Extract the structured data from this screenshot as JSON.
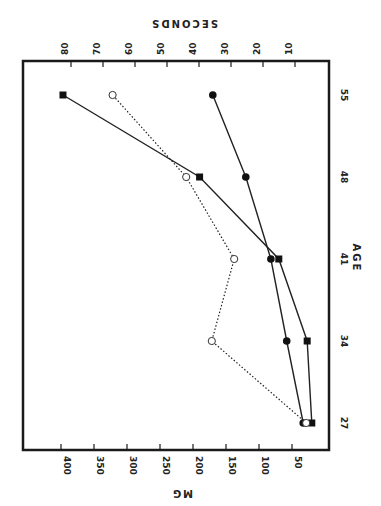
{
  "chart_data": {
    "type": "line",
    "title": "",
    "orientation": "rotated-90-counterclockwise",
    "xlabel": "AGE",
    "ylabel_left": "MG",
    "ylabel_right": "SECONDS",
    "x": [
      27,
      34,
      41,
      48,
      55
    ],
    "x_tick_labels": [
      "27",
      "34",
      "41",
      "48",
      "55"
    ],
    "mg_ticks": [
      50,
      100,
      150,
      200,
      250,
      300,
      350,
      400
    ],
    "mg_tick_labels": [
      "50",
      "100",
      "150",
      "200",
      "250",
      "300",
      "350",
      "400"
    ],
    "seconds_ticks": [
      10,
      20,
      30,
      40,
      50,
      60,
      70,
      80
    ],
    "seconds_tick_labels": [
      "10",
      "20",
      "30",
      "40",
      "50",
      "60",
      "70",
      "80"
    ],
    "mg_range": [
      0,
      420
    ],
    "seconds_range": [
      0,
      85
    ],
    "grid": false,
    "legend": "none",
    "series": [
      {
        "name": "filled-squares",
        "axis": "mg",
        "marker": "square-filled",
        "line": "solid",
        "values": [
          20,
          27,
          70,
          190,
          397
        ]
      },
      {
        "name": "filled-circles",
        "axis": "mg",
        "marker": "circle-filled",
        "line": "solid",
        "values": [
          33,
          58,
          82,
          120,
          170
        ]
      },
      {
        "name": "open-circles",
        "axis": "seconds",
        "marker": "circle-open",
        "line": "dotted",
        "values": [
          6.5,
          36,
          29,
          44,
          67
        ]
      }
    ]
  }
}
